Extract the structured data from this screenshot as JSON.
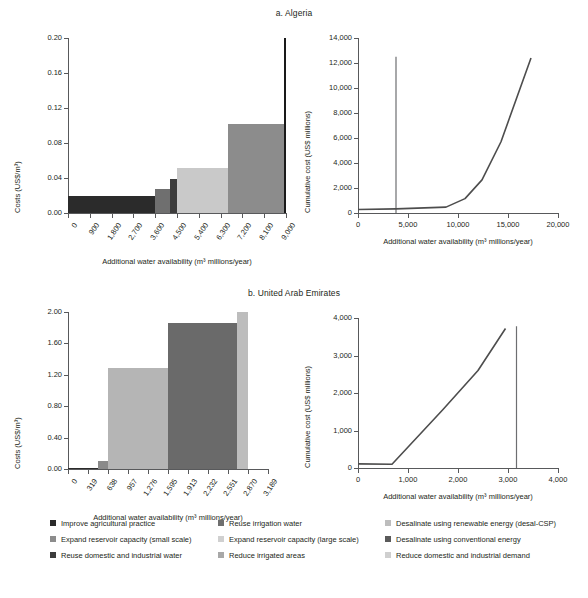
{
  "figure": {
    "panels": [
      {
        "title": "a. Algeria"
      },
      {
        "title": "b. United Arab Emirates"
      }
    ]
  },
  "legend": {
    "items": [
      {
        "label": "Improve agricultural practice",
        "color": "#2b2b2b"
      },
      {
        "label": "Expand reservoir capacity (small scale)",
        "color": "#8c8c8c"
      },
      {
        "label": "Reuse domestic and industrial water",
        "color": "#3c3c3c"
      },
      {
        "label": "Reuse irrigation water",
        "color": "#6f6f6f"
      },
      {
        "label": "Expand reservoir capacity (large scale)",
        "color": "#d0d0d0"
      },
      {
        "label": "Reduce irrigated areas",
        "color": "#a8a8a8"
      },
      {
        "label": "Desalinate using renewable energy (desal-CSP)",
        "color": "#bdbdbd"
      },
      {
        "label": "Desalinate using conventional energy",
        "color": "#5a5a5a"
      },
      {
        "label": "Reduce domestic and industrial demand",
        "color": "#cfcfcf"
      }
    ]
  },
  "chart_data": [
    {
      "id": "algeria-cost-curve",
      "type": "bar",
      "title": "a. Algeria",
      "xlabel": "Additional water availability (m³ millions/year)",
      "ylabel": "Costs (US$/m³)",
      "xlim": [
        0,
        9000
      ],
      "ylim": [
        0,
        0.2
      ],
      "xticks": [
        "0",
        "900",
        "1,800",
        "2,700",
        "3,600",
        "4,500",
        "5,400",
        "6,300",
        "7,200",
        "8,100",
        "9,000"
      ],
      "xtick_values": [
        0,
        900,
        1800,
        2700,
        3600,
        4500,
        5400,
        6300,
        7200,
        8100,
        9000
      ],
      "yticks": [
        "0.00",
        "0.04",
        "0.08",
        "0.12",
        "0.16",
        "0.20"
      ],
      "ytick_values": [
        0,
        0.04,
        0.08,
        0.12,
        0.16,
        0.2
      ],
      "grid": false,
      "legend_position": "bottom",
      "bars": [
        {
          "measure": "Improve agricultural practice",
          "x0": 0,
          "x1": 3600,
          "cost": 0.02,
          "color": "#2b2b2b"
        },
        {
          "measure": "Reuse irrigation water",
          "x0": 3600,
          "x1": 4200,
          "cost": 0.028,
          "color": "#6f6f6f"
        },
        {
          "measure": "Reuse domestic and industrial water",
          "x0": 4200,
          "x1": 4500,
          "cost": 0.039,
          "color": "#3c3c3c"
        },
        {
          "measure": "Expand reservoir capacity (large scale)",
          "x0": 4500,
          "x1": 6600,
          "cost": 0.051,
          "color": "#c9c9c9"
        },
        {
          "measure": "Expand reservoir capacity (small scale)",
          "x0": 6600,
          "x1": 8900,
          "cost": 0.102,
          "color": "#8c8c8c"
        },
        {
          "measure": "Desalinate using conventional energy",
          "x0": 8900,
          "x1": 9000,
          "cost": 0.2,
          "color": "#1a1a1a"
        }
      ]
    },
    {
      "id": "algeria-cumulative-cost",
      "type": "line",
      "title": "a. Algeria",
      "xlabel": "Additional water availability (m³ millions/year)",
      "ylabel": "Cumulative cost (US$ millions)",
      "xlim": [
        0,
        20000
      ],
      "ylim": [
        0,
        14000
      ],
      "xticks": [
        "0",
        "5,000",
        "10,000",
        "15,000",
        "20,000"
      ],
      "xtick_values": [
        0,
        5000,
        10000,
        15000,
        20000
      ],
      "yticks": [
        "0",
        "2,000",
        "4,000",
        "6,000",
        "8,000",
        "10,000",
        "12,000",
        "14,000"
      ],
      "ytick_values": [
        0,
        2000,
        4000,
        6000,
        8000,
        10000,
        12000,
        14000
      ],
      "grid": false,
      "series": [
        {
          "name": "Cumulative cost",
          "color": "#4d4d4d",
          "x": [
            0,
            3800,
            8800,
            10700,
            12400,
            14300,
            17300
          ],
          "y": [
            280,
            330,
            470,
            1150,
            2650,
            5700,
            12400
          ]
        }
      ],
      "annotations": [
        {
          "type": "vertical-line",
          "x": 3800,
          "y0": 0,
          "y1": 12500,
          "color": "#6d6e71"
        }
      ]
    },
    {
      "id": "uae-cost-curve",
      "type": "bar",
      "title": "b. United Arab Emirates",
      "xlabel": "Additional water availability (m³ millions/year)",
      "ylabel": "Costs (US$/m³)",
      "xlim": [
        0,
        3189
      ],
      "ylim": [
        0,
        2.0
      ],
      "xticks": [
        "0",
        "319",
        "638",
        "957",
        "1,276",
        "1,595",
        "1,913",
        "2,232",
        "2,551",
        "2,870",
        "3,189"
      ],
      "xtick_values": [
        0,
        319,
        638,
        957,
        1276,
        1595,
        1913,
        2232,
        2551,
        2870,
        3189
      ],
      "yticks": [
        "0.00",
        "0.40",
        "0.80",
        "1.20",
        "1.60",
        "2.00"
      ],
      "ytick_values": [
        0,
        0.4,
        0.8,
        1.2,
        1.6,
        2.0
      ],
      "grid": false,
      "legend_position": "bottom",
      "bars": [
        {
          "measure": "Improve agricultural practice",
          "x0": 0,
          "x1": 480,
          "cost": 0.01,
          "color": "#2b2b2b"
        },
        {
          "measure": "Reduce irrigated areas",
          "x0": 480,
          "x1": 638,
          "cost": 0.1,
          "color": "#8a8a8a"
        },
        {
          "measure": "Reduce domestic and industrial demand",
          "x0": 638,
          "x1": 1595,
          "cost": 1.29,
          "color": "#b5b5b5"
        },
        {
          "measure": "Desalinate using conventional energy",
          "x0": 1595,
          "x1": 2700,
          "cost": 1.86,
          "color": "#6a6a6a"
        },
        {
          "measure": "Desalinate using renewable energy (desal-CSP)",
          "x0": 2700,
          "x1": 2870,
          "cost": 2.0,
          "color": "#bdbdbd"
        }
      ]
    },
    {
      "id": "uae-cumulative-cost",
      "type": "line",
      "title": "b. United Arab Emirates",
      "xlabel": "Additional water availability (m³ millions/year)",
      "ylabel": "Cumulative cost (US$ millions)",
      "xlim": [
        0,
        4000
      ],
      "ylim": [
        0,
        4000
      ],
      "xticks": [
        "0",
        "1,000",
        "2,000",
        "3,000",
        "4,000"
      ],
      "xtick_values": [
        0,
        1000,
        2000,
        3000,
        4000
      ],
      "yticks": [
        "0",
        "1,000",
        "2,000",
        "3,000",
        "4,000"
      ],
      "ytick_values": [
        0,
        1000,
        2000,
        3000,
        4000
      ],
      "grid": false,
      "series": [
        {
          "name": "Cumulative cost",
          "color": "#4d4d4d",
          "x": [
            0,
            680,
            1700,
            2400,
            2950
          ],
          "y": [
            110,
            100,
            1560,
            2600,
            3720
          ]
        }
      ],
      "annotations": [
        {
          "type": "vertical-line",
          "x": 3170,
          "y0": 0,
          "y1": 3780,
          "color": "#6d6e71"
        }
      ]
    }
  ]
}
